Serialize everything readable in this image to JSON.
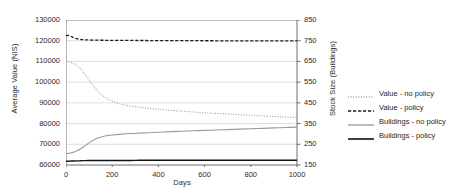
{
  "chart_data": {
    "type": "line",
    "title": "",
    "xlabel": "Days",
    "ylabel": "Average Value (NIS)",
    "y2label": "Stock Size (Buildings)",
    "xlim": [
      0,
      1000
    ],
    "ylim": [
      60000,
      130000
    ],
    "y2lim": [
      150,
      850
    ],
    "grid": true,
    "legend_position": "right",
    "xticks": [
      "0",
      "200",
      "400",
      "600",
      "800",
      "1000"
    ],
    "xtick_values": [
      0,
      200,
      400,
      600,
      800,
      1000
    ],
    "yticks": [
      "60000",
      "70000",
      "80000",
      "90000",
      "100000",
      "110000",
      "120000",
      "130000"
    ],
    "ytick_values": [
      60000,
      70000,
      80000,
      90000,
      100000,
      110000,
      120000,
      130000
    ],
    "y2ticks": [
      "150",
      "250",
      "350",
      "450",
      "550",
      "650",
      "750",
      "850"
    ],
    "y2tick_values": [
      150,
      250,
      350,
      450,
      550,
      650,
      750,
      850
    ],
    "x": [
      0,
      10,
      20,
      30,
      40,
      50,
      60,
      70,
      80,
      90,
      100,
      120,
      140,
      160,
      180,
      200,
      240,
      280,
      320,
      360,
      400,
      450,
      500,
      550,
      600,
      650,
      700,
      750,
      800,
      850,
      900,
      950,
      1000
    ],
    "series": [
      {
        "name": "Value - no policy",
        "axis": "left",
        "style": "dotted",
        "color": "#9a9a9a",
        "width": 1.1,
        "values": [
          110000,
          109850,
          109550,
          109100,
          108500,
          107700,
          106700,
          105500,
          104100,
          102600,
          101000,
          98000,
          95400,
          93400,
          91900,
          90800,
          89300,
          88400,
          87800,
          87300,
          86900,
          86400,
          86000,
          85600,
          85200,
          84900,
          84600,
          84300,
          84000,
          83700,
          83400,
          83150,
          82900
        ]
      },
      {
        "name": "Value - policy",
        "axis": "left",
        "style": "dashed",
        "color": "#1c1c1c",
        "width": 1.3,
        "values": [
          122400,
          122600,
          122200,
          121600,
          121200,
          120900,
          120700,
          120550,
          120450,
          120400,
          120350,
          120300,
          120250,
          120220,
          120200,
          120180,
          120150,
          120130,
          120110,
          120090,
          120070,
          120050,
          120030,
          120010,
          119990,
          119970,
          119960,
          119940,
          119930,
          119910,
          119900,
          119890,
          119880
        ]
      },
      {
        "name": "Buildings - no policy",
        "axis": "right",
        "style": "solid",
        "color": "#9a9a9a",
        "width": 1.1,
        "values": [
          205,
          206,
          208,
          211,
          215,
          220,
          226,
          233,
          241,
          249,
          257,
          271,
          281,
          288,
          292,
          295,
          299,
          302,
          304,
          306,
          308,
          311,
          313,
          315,
          317,
          319,
          321,
          323,
          325,
          327,
          329,
          331,
          333
        ]
      },
      {
        "name": "Buildings - policy",
        "axis": "right",
        "style": "solid",
        "color": "#111111",
        "width": 1.4,
        "values": [
          168,
          168,
          169,
          169,
          170,
          170,
          170,
          171,
          171,
          171,
          172,
          172,
          172,
          172,
          172,
          172,
          172,
          172,
          173,
          173,
          173,
          173,
          173,
          173,
          173,
          173,
          173,
          173,
          173,
          173,
          173,
          173,
          173
        ]
      }
    ]
  },
  "legend": {
    "items": [
      {
        "label": "Value - no policy"
      },
      {
        "label": "Value - policy"
      },
      {
        "label": "Buildings - no policy"
      },
      {
        "label": "Buildings - policy"
      }
    ]
  },
  "colors": {
    "grid": "#c8c8c8",
    "axis": "#4a4a4a",
    "background": "#ffffff",
    "value_no_policy": "#9a9a9a",
    "value_policy": "#1c1c1c",
    "buildings_no_policy": "#9a9a9a",
    "buildings_policy": "#111111"
  }
}
